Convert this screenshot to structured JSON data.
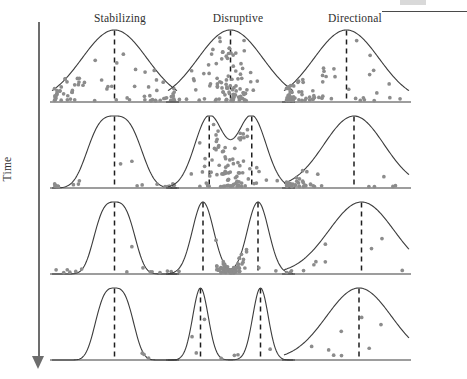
{
  "figure": {
    "title_present": false,
    "axis": {
      "vertical_label": "Time",
      "direction": "downward",
      "arrow_icon": "down-arrow-icon"
    },
    "columns": [
      {
        "id": "stabilizing",
        "label": "Stabilizing"
      },
      {
        "id": "disruptive",
        "label": "Disruptive"
      },
      {
        "id": "directional",
        "label": "Directional"
      }
    ],
    "rows": 4,
    "colors": {
      "curve_stroke": "#3c3c3c",
      "mean_line": "#1e1e1e",
      "dot_fill": "#8c8c8c",
      "axis": "#6d6d6d",
      "text": "#2f2f2f",
      "background": "#ffffff"
    },
    "legend": {
      "dot_meaning": "individual selected against",
      "dashed_line_meaning": "population mean / selected peak"
    }
  },
  "chart_data": {
    "type": "line",
    "xlabel": "Phenotype",
    "ylabel": "Number of individuals",
    "grid": false,
    "legend_position": "none",
    "columns": [
      "Stabilizing",
      "Disruptive",
      "Directional"
    ],
    "row_axis": "Time",
    "panels": [
      {
        "row": 1,
        "column": "Stabilizing",
        "curve": "unimodal-broad",
        "peak_x": 0.5,
        "spread": 0.26,
        "mean_lines": [
          0.5
        ],
        "selection_zone": "both tails",
        "dot_count": 74,
        "dot_clusters": [
          "left-tail",
          "right-tail"
        ]
      },
      {
        "row": 1,
        "column": "Disruptive",
        "curve": "unimodal-broad",
        "peak_x": 0.5,
        "spread": 0.26,
        "mean_lines": [
          0.5
        ],
        "selection_zone": "center",
        "dot_count": 96,
        "dot_clusters": [
          "center"
        ]
      },
      {
        "row": 1,
        "column": "Directional",
        "curve": "unimodal-broad",
        "peak_x": 0.5,
        "spread": 0.26,
        "mean_lines": [
          0.5
        ],
        "selection_zone": "left tail",
        "dot_count": 70,
        "dot_clusters": [
          "left"
        ]
      },
      {
        "row": 2,
        "column": "Stabilizing",
        "curve": "unimodal-narrower",
        "peak_x": 0.5,
        "spread": 0.2,
        "mean_lines": [
          0.5
        ],
        "selection_zone": "both tails",
        "dot_count": 22,
        "dot_clusters": [
          "left-base",
          "right-base"
        ]
      },
      {
        "row": 2,
        "column": "Disruptive",
        "curve": "bimodal-shallow",
        "peak_x": [
          0.33,
          0.67
        ],
        "valley_depth": 0.12,
        "mean_lines": [
          0.33,
          0.67
        ],
        "selection_zone": "center",
        "dot_count": 92,
        "dot_clusters": [
          "center"
        ]
      },
      {
        "row": 2,
        "column": "Directional",
        "curve": "unimodal-shifted-right",
        "peak_x": 0.56,
        "spread": 0.24,
        "mean_lines": [
          0.56
        ],
        "selection_zone": "left tail",
        "dot_count": 38,
        "dot_clusters": [
          "left-base"
        ]
      },
      {
        "row": 3,
        "column": "Stabilizing",
        "curve": "unimodal-narrow",
        "peak_x": 0.5,
        "spread": 0.15,
        "mean_lines": [
          0.5
        ],
        "selection_zone": "both tails",
        "dot_count": 14,
        "dot_clusters": [
          "left-base",
          "right-base"
        ]
      },
      {
        "row": 3,
        "column": "Disruptive",
        "curve": "bimodal-deep",
        "peak_x": [
          0.28,
          0.72
        ],
        "valley_depth": 0.45,
        "mean_lines": [
          0.28,
          0.72
        ],
        "selection_zone": "center valley",
        "dot_count": 78,
        "dot_clusters": [
          "center"
        ]
      },
      {
        "row": 3,
        "column": "Directional",
        "curve": "unimodal-shifted-right",
        "peak_x": 0.62,
        "spread": 0.26,
        "mean_lines": [
          0.62
        ],
        "selection_zone": "left tail",
        "dot_count": 9,
        "dot_clusters": [
          "left-base"
        ]
      },
      {
        "row": 4,
        "column": "Stabilizing",
        "curve": "unimodal-narrow",
        "peak_x": 0.5,
        "spread": 0.14,
        "mean_lines": [
          0.5
        ],
        "selection_zone": "none",
        "dot_count": 3,
        "dot_clusters": [
          "scattered"
        ]
      },
      {
        "row": 4,
        "column": "Disruptive",
        "curve": "bimodal-separated",
        "peak_x": [
          0.26,
          0.74
        ],
        "valley_depth": 0.95,
        "mean_lines": [
          0.26,
          0.74
        ],
        "selection_zone": "none",
        "dot_count": 7,
        "dot_clusters": [
          "scattered"
        ]
      },
      {
        "row": 4,
        "column": "Directional",
        "curve": "unimodal-shifted-right",
        "peak_x": 0.6,
        "spread": 0.26,
        "mean_lines": [
          0.6
        ],
        "selection_zone": "none",
        "dot_count": 8,
        "dot_clusters": [
          "scattered"
        ]
      }
    ]
  }
}
